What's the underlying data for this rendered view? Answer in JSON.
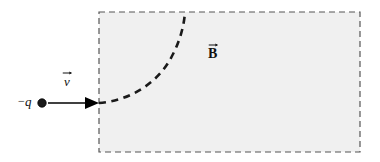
{
  "figure": {
    "canvas": {
      "width": 380,
      "height": 162,
      "background": "#ffffff"
    },
    "field_region": {
      "name": "magnetic-field-region",
      "label": "B",
      "label_has_vector_arrow": true,
      "label_x": 215,
      "label_y": 52,
      "x": 99,
      "y": 12,
      "width": 261,
      "height": 140,
      "fill_color": "#f0f0f0",
      "border_style": "dashed",
      "border_color": "#555555",
      "border_width": 1.2,
      "dash_pattern": "6 4"
    },
    "charge": {
      "name": "negative-point-charge",
      "label": "q",
      "sign": "−",
      "dot_x": 42,
      "dot_y": 103,
      "dot_radius": 4.2,
      "dot_color": "#1a1a1a"
    },
    "velocity_arrow": {
      "name": "velocity-vector",
      "label": "v",
      "label_has_vector_arrow": true,
      "label_x": 71,
      "label_y": 80,
      "x1": 48,
      "y1": 103,
      "x2": 99,
      "y2": 103,
      "color": "#000000",
      "line_width": 1.4,
      "head_length": 13,
      "head_half_width": 6
    },
    "trajectory": {
      "name": "charge-trajectory-arc",
      "description": "dashed quarter-circle arc curving upward from entry point to top boundary",
      "start_x": 99,
      "start_y": 103,
      "end_x": 185,
      "end_y": 12,
      "path": "M 99 103 C 128 101, 158 84, 172 56 C 180 41, 184 26, 185 12",
      "color": "#1a1a1a",
      "line_width": 2.6,
      "dash_pattern": "7 5.5"
    }
  }
}
